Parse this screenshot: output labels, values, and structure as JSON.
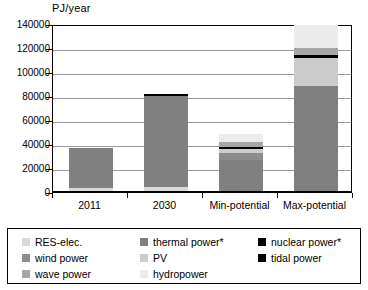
{
  "chart_data": {
    "type": "bar",
    "stacked": true,
    "title": "",
    "xlabel": "",
    "ylabel": "PJ/year",
    "ylim": [
      0,
      140000
    ],
    "ytick_step": 20000,
    "yticks": [
      0,
      20000,
      40000,
      60000,
      80000,
      100000,
      120000,
      140000
    ],
    "grid": true,
    "legend_position": "bottom",
    "categories": [
      "2011",
      "2030",
      "Min-potential",
      "Max-potential"
    ],
    "series": [
      {
        "name": "RES-elec.",
        "color": "#d9d9d9",
        "values": [
          3500,
          4200,
          0,
          0
        ]
      },
      {
        "name": "thermal power*",
        "color": "#808080",
        "values": [
          33000,
          75800,
          26500,
          88000
        ]
      },
      {
        "name": "nuclear power*",
        "color": "#000000",
        "values": [
          0,
          1500,
          0,
          0
        ]
      },
      {
        "name": "wind power",
        "color": "#8c8c8c",
        "values": [
          0,
          0,
          5800,
          0
        ]
      },
      {
        "name": "PV",
        "color": "#cccccc",
        "values": [
          0,
          0,
          3800,
          24000
        ]
      },
      {
        "name": "tidal power",
        "color": "#000000",
        "values": [
          0,
          0,
          1200,
          1800
        ]
      },
      {
        "name": "wave power",
        "color": "#a6a6a6",
        "values": [
          0,
          0,
          4500,
          6500
        ]
      },
      {
        "name": "hydropower",
        "color": "#ececec",
        "values": [
          0,
          0,
          6200,
          19000
        ]
      }
    ],
    "totals": [
      36500,
      81500,
      48000,
      139300
    ]
  },
  "legend": {
    "entries": [
      {
        "label": "RES-elec.",
        "color": "#d9d9d9"
      },
      {
        "label": "thermal power*",
        "color": "#808080"
      },
      {
        "label": "nuclear power*",
        "color": "#000000"
      },
      {
        "label": "wind power",
        "color": "#8c8c8c"
      },
      {
        "label": "PV",
        "color": "#cccccc"
      },
      {
        "label": "tidal power",
        "color": "#000000"
      },
      {
        "label": "wave power",
        "color": "#a6a6a6"
      },
      {
        "label": "hydropower",
        "color": "#ececec"
      }
    ]
  }
}
